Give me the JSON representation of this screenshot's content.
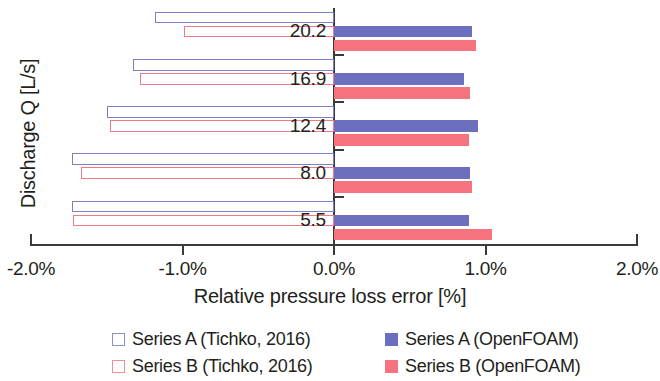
{
  "chart_data": {
    "type": "bar",
    "orientation": "horizontal",
    "title": "",
    "xlabel": "Relative pressure loss error [%]",
    "ylabel": "Discharge Q [L/s]",
    "categories": [
      "20.2",
      "16.9",
      "12.4",
      "8.0",
      "5.5"
    ],
    "xlim": [
      -2.0,
      2.0
    ],
    "xticks": [
      "-2.0%",
      "-1.0%",
      "0.0%",
      "1.0%",
      "2.0%"
    ],
    "xtick_values": [
      -2.0,
      -1.0,
      0.0,
      1.0,
      2.0
    ],
    "grid": false,
    "legend_position": "bottom",
    "series": [
      {
        "name": "Series A (Tichko, 2016)",
        "style": "hollow",
        "color": "#7b7fc4",
        "values": [
          -1.18,
          -1.33,
          -1.5,
          -1.73,
          -1.73
        ]
      },
      {
        "name": "Series B (Tichko, 2016)",
        "style": "hollow",
        "color": "#f07a85",
        "values": [
          -0.99,
          -1.28,
          -1.48,
          -1.67,
          -1.72
        ]
      },
      {
        "name": "Series A (OpenFOAM)",
        "style": "solid",
        "color": "#6b6fbd",
        "values": [
          0.91,
          0.86,
          0.95,
          0.9,
          0.89
        ]
      },
      {
        "name": "Series B (OpenFOAM)",
        "style": "solid",
        "color": "#f4737f",
        "values": [
          0.94,
          0.9,
          0.89,
          0.91,
          1.04
        ]
      }
    ]
  },
  "axes": {
    "y_title": "Discharge Q [L/s]",
    "x_title": "Relative pressure loss error [%]",
    "x_tick_labels": [
      "-2.0%",
      "-1.0%",
      "0.0%",
      "1.0%",
      "2.0%"
    ],
    "category_labels": [
      "20.2",
      "16.9",
      "12.4",
      "8.0",
      "5.5"
    ]
  },
  "legend": {
    "left_column": [
      {
        "label": "Series A (Tichko, 2016)",
        "swatch": "hollow-a"
      },
      {
        "label": "Series B (Tichko, 2016)",
        "swatch": "hollow-b"
      }
    ],
    "right_column": [
      {
        "label": "Series A (OpenFOAM)",
        "swatch": "solid-a"
      },
      {
        "label": "Series B (OpenFOAM)",
        "swatch": "solid-b"
      }
    ]
  },
  "colors": {
    "series_a_outline": "#7b7fc4",
    "series_b_outline": "#f07a85",
    "series_a_fill": "#6b6fbd",
    "series_b_fill": "#f4737f",
    "axis": "#3b3b3b",
    "text": "#231f20"
  }
}
